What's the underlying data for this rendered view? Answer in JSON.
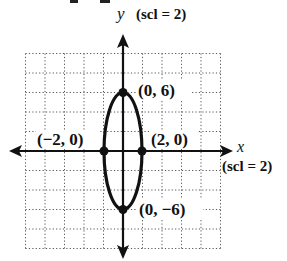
{
  "chart_data": {
    "type": "line",
    "title": "",
    "xlabel": "x",
    "ylabel": "y",
    "x_scale_label": "(scl = 2)",
    "y_scale_label": "(scl = 2)",
    "xlim": [
      -10,
      10
    ],
    "ylim": [
      -10,
      10
    ],
    "grid": true,
    "grid_style": "dotted",
    "grid_step": 2,
    "series": [
      {
        "name": "ellipse",
        "equation": "x^2/4 + y^2/36 = 1",
        "center": [
          0,
          0
        ],
        "semi_axis_x": 2,
        "semi_axis_y": 6
      }
    ],
    "points": [
      {
        "label": "(0, 6)",
        "x": 0,
        "y": 6
      },
      {
        "label": "(−2, 0)",
        "x": -2,
        "y": 0
      },
      {
        "label": "(2, 0)",
        "x": 2,
        "y": 0
      },
      {
        "label": "(0, −6)",
        "x": 0,
        "y": -6
      }
    ]
  },
  "labels": {
    "y_axis": "y",
    "y_scl": "(scl = 2)",
    "x_axis": "x",
    "x_scl": "(scl = 2)",
    "p_top": "(0, 6)",
    "p_left": "(−2, 0)",
    "p_right": "(2, 0)",
    "p_bottom": "(0, −6)"
  }
}
